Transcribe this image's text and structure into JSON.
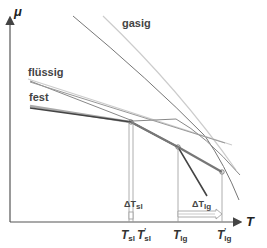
{
  "diagram": {
    "axes": {
      "y_label": "μ",
      "x_label": "T"
    },
    "phases": {
      "gas": "gasig",
      "liquid": "flüssig",
      "solid": "fest"
    },
    "ticks": {
      "t_sl": {
        "main": "T",
        "sub": "sl"
      },
      "t_sl_prime": {
        "main": "T",
        "sub": "sl",
        "prime": "'"
      },
      "t_lg": {
        "main": "T",
        "sub": "lg"
      },
      "t_lg_prime": {
        "main": "T",
        "sub": "lg",
        "prime": "'"
      }
    },
    "deltas": {
      "delta_sl": {
        "main": "ΔT",
        "sub": "sl"
      },
      "delta_lg": {
        "main": "ΔT",
        "sub": "lg"
      }
    },
    "colors": {
      "axis": "#555555",
      "solid_line": "#444444",
      "liquid_line": "#888888",
      "gas_line": "#777777",
      "shifted_line": "#cccccc"
    }
  }
}
